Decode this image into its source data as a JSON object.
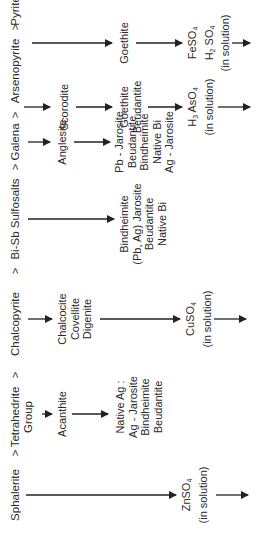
{
  "diagram": {
    "type": "mineral-oxidation-sequence",
    "orientation": "rotated-90-ccw",
    "separator": ">",
    "columns": [
      {
        "primary": "Sphalerite",
        "stages": [],
        "solution": {
          "formula": "ZnSO",
          "sub": "4",
          "note": "(in solution)"
        }
      },
      {
        "primary": "Tetrahedrite Group",
        "primary_lines": [
          "Tetrahedrite",
          "Group"
        ],
        "stages": [
          [
            "Acanthite"
          ],
          [
            "Native Ag :",
            "Ag - Jarosite",
            "Bindheimite",
            "Beudantite"
          ]
        ],
        "solution": null
      },
      {
        "primary": "Chalcopyrite",
        "stages": [
          [
            "Chalcocite",
            "Covellite",
            "Digenite"
          ]
        ],
        "solution": {
          "formula": "CuSO",
          "sub": "4",
          "note": "(in solution)"
        }
      },
      {
        "primary": "Bi-Sb Sulfosalts",
        "stages": [
          [
            "Bindheimite",
            "(Pb, Ag) Jarosite",
            "Beudantite",
            "Native Bi"
          ]
        ],
        "solution": null
      },
      {
        "primary": "Galena",
        "stages": [
          [
            "Anglesite"
          ],
          [
            "Pb - Jarosite",
            "Beudantite",
            "Bindheimite",
            "Native Bi",
            "Ag - Jarosite"
          ]
        ],
        "solution": null
      },
      {
        "primary": "Arsenopyrite",
        "stages": [
          [
            "Scorodite"
          ],
          [
            "Goethite",
            "Beudantite"
          ]
        ],
        "solution": {
          "formula": "H3 AsO4",
          "note": "(in solution)"
        }
      },
      {
        "primary": "Pyrite",
        "stages": [
          [
            "Goethite"
          ]
        ],
        "solution": {
          "formula": "FeSO4 H2 SO4",
          "note": "(in solution)"
        }
      }
    ]
  },
  "labels": {
    "gt": ">",
    "sphalerite": "Sphalerite",
    "tetra1": "Tetrahedrite",
    "tetra2": "Group",
    "chalcopyrite": "Chalcopyrite",
    "bisb": "Bi-Sb Sulfosalts",
    "galena": "Galena",
    "arsenopyrite": "Arsenopyrite",
    "pyrite": "Pyrite",
    "acanthite": "Acanthite",
    "nativeag": [
      "Native Ag :",
      "Ag - Jarosite",
      "Bindheimite",
      "Beudantite"
    ],
    "chalcocite": [
      "Chalcocite",
      "Covellite",
      "Digenite"
    ],
    "bisb_products": [
      "Bindheimite",
      "(Pb, Ag) Jarosite",
      "Beudantite",
      "Native Bi"
    ],
    "anglesite": "Anglesite",
    "galena_products": [
      "Pb - Jarosite",
      "Beudantite",
      "Bindheimite",
      "Native Bi",
      "Ag - Jarosite"
    ],
    "scorodite": "Scorodite",
    "arseno_products": [
      "Goethite",
      "Beudantite"
    ],
    "goethite": "Goethite",
    "znso4": "ZnSO",
    "cuso4": "CuSO",
    "h3aso4_h": "H",
    "h3aso4_rest": " AsO",
    "feso4": "FeSO",
    "h2so4_h": "H",
    "h2so4_rest": " SO",
    "sub3": "3",
    "sub2": "2",
    "sub4": "4",
    "in_solution": "(in solution)"
  }
}
